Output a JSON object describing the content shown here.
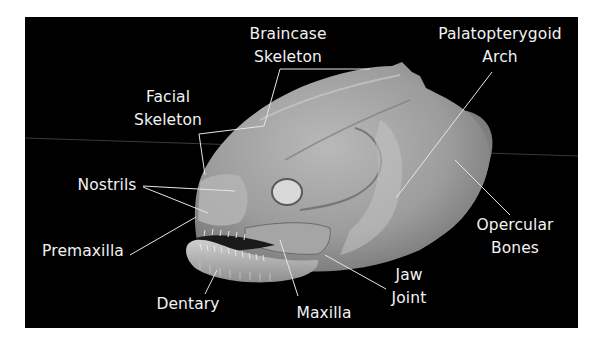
{
  "figure": {
    "background_color": "#000000",
    "border_color": "#ffffff",
    "label_color": "#f2f2f2",
    "leader_line_color": "#e6e6e6"
  },
  "labels": {
    "braincase": {
      "line1": "Braincase",
      "line2": "Skeleton"
    },
    "facial": {
      "line1": "Facial",
      "line2": "Skeleton"
    },
    "palatopterygoid": {
      "line1": "Palatopterygoid",
      "line2": "Arch"
    },
    "nostrils": {
      "text": "Nostrils"
    },
    "premaxilla": {
      "text": "Premaxilla"
    },
    "dentary": {
      "text": "Dentary"
    },
    "maxilla": {
      "text": "Maxilla"
    },
    "jaw_joint": {
      "line1": "Jaw",
      "line2": "Joint"
    },
    "opercular": {
      "line1": "Opercular",
      "line2": "Bones"
    }
  }
}
